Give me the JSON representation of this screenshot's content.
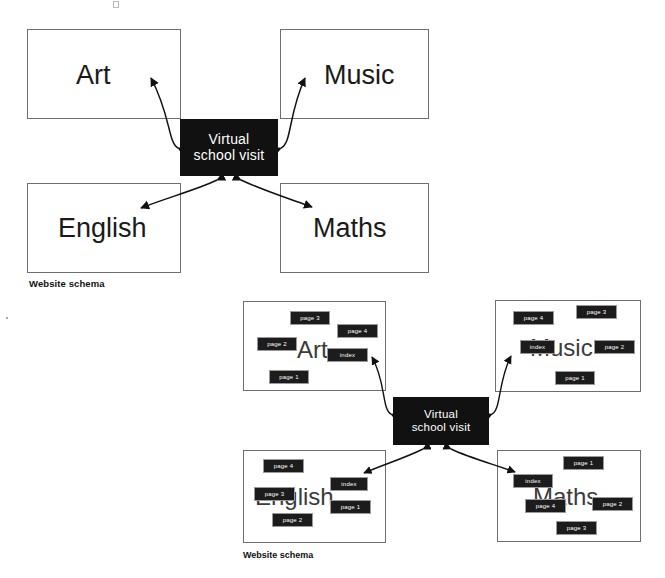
{
  "figure": {
    "title_text": "",
    "background": "#ffffff",
    "hub_color": "#111111",
    "box_border_color": "#6e6e6e",
    "chip_color": "#1c1c1c"
  },
  "top_diagram": {
    "caption": "Website schema",
    "hub": {
      "line1": "Virtual",
      "line2": "school visit"
    },
    "subjects": [
      {
        "key": "art",
        "label": "Art"
      },
      {
        "key": "music",
        "label": "Music"
      },
      {
        "key": "english",
        "label": "English"
      },
      {
        "key": "maths",
        "label": "Maths"
      }
    ]
  },
  "bottom_diagram": {
    "caption": "Website schema",
    "hub": {
      "line1": "Virtual",
      "line2": "school visit"
    },
    "subjects": [
      {
        "key": "art",
        "label": "Art",
        "pages": [
          {
            "label": "page 3"
          },
          {
            "label": "page 4"
          },
          {
            "label": "page 2"
          },
          {
            "label": "index"
          },
          {
            "label": "page 1"
          }
        ]
      },
      {
        "key": "music",
        "label": "Music",
        "pages": [
          {
            "label": "page 4"
          },
          {
            "label": "page 3"
          },
          {
            "label": "index"
          },
          {
            "label": "page 2"
          },
          {
            "label": "page 1"
          }
        ]
      },
      {
        "key": "english",
        "label": "English",
        "pages": [
          {
            "label": "page 4"
          },
          {
            "label": "index"
          },
          {
            "label": "page 3"
          },
          {
            "label": "page 1"
          },
          {
            "label": "page 2"
          }
        ]
      },
      {
        "key": "maths",
        "label": "Maths",
        "pages": [
          {
            "label": "page 1"
          },
          {
            "label": "index"
          },
          {
            "label": "page 4"
          },
          {
            "label": "page 2"
          },
          {
            "label": "page 3"
          }
        ]
      }
    ]
  }
}
